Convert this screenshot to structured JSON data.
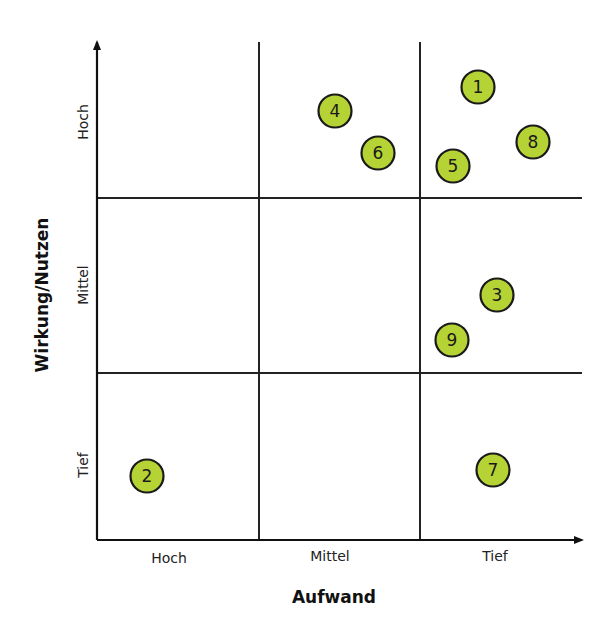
{
  "chart_data": {
    "type": "scatter",
    "title": "",
    "xlabel": "Aufwand",
    "ylabel": "Wirkung/Nutzen",
    "x_categories": [
      "Hoch",
      "Mittel",
      "Tief"
    ],
    "y_categories": [
      "Tief",
      "Mittel",
      "Hoch"
    ],
    "grid": "3x3",
    "bubble_color": "#b5d334",
    "bubble_stroke": "#1a1a1a",
    "points": [
      {
        "label": "1",
        "x_category": "Tief",
        "y_category": "Hoch",
        "cx": 478,
        "cy": 87
      },
      {
        "label": "2",
        "x_category": "Hoch",
        "y_category": "Tief",
        "cx": 147,
        "cy": 476
      },
      {
        "label": "3",
        "x_category": "Tief",
        "y_category": "Mittel",
        "cx": 497,
        "cy": 295
      },
      {
        "label": "4",
        "x_category": "Mittel",
        "y_category": "Hoch",
        "cx": 335,
        "cy": 111
      },
      {
        "label": "5",
        "x_category": "Tief",
        "y_category": "Hoch",
        "cx": 453,
        "cy": 166
      },
      {
        "label": "6",
        "x_category": "Mittel",
        "y_category": "Hoch",
        "cx": 378,
        "cy": 153
      },
      {
        "label": "7",
        "x_category": "Tief",
        "y_category": "Tief",
        "cx": 493,
        "cy": 470
      },
      {
        "label": "8",
        "x_category": "Tief",
        "y_category": "Hoch",
        "cx": 533,
        "cy": 142
      },
      {
        "label": "9",
        "x_category": "Tief",
        "y_category": "Mittel",
        "cx": 452,
        "cy": 340
      }
    ]
  },
  "axes": {
    "x_title": "Aufwand",
    "y_title": "Wirkung/Nutzen",
    "x_ticks": [
      "Hoch",
      "Mittel",
      "Tief"
    ],
    "y_ticks": [
      "Hoch",
      "Mittel",
      "Tief"
    ]
  }
}
